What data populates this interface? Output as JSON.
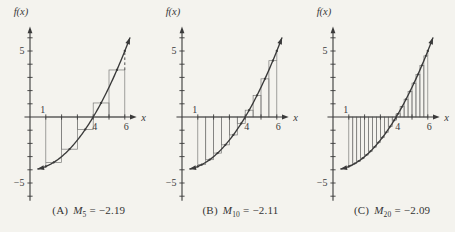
{
  "figure": {
    "background": "#f4f3ee",
    "ink": "#3a3a3a",
    "rect_line": "#7a7a78"
  },
  "chart_data": [
    {
      "type": "line",
      "xlabel": "x",
      "ylabel": "f(x)",
      "xlim": [
        -0.35,
        6.9
      ],
      "ylim": [
        -6.4,
        6.9
      ],
      "x_ticks": [
        1,
        2,
        3,
        4,
        5,
        6
      ],
      "y_ticks": [
        -6,
        -5,
        -4,
        -3,
        -2,
        -1,
        1,
        2,
        3,
        4,
        5,
        6
      ],
      "x_tick_labels": [
        {
          "v": 1,
          "t": "1",
          "side": "above"
        },
        {
          "v": 4,
          "t": "4",
          "side": "below"
        },
        {
          "v": 6,
          "t": "6",
          "side": "below"
        }
      ],
      "y_tick_labels": [
        {
          "v": 5,
          "t": "5"
        },
        {
          "v": -5,
          "t": "−5"
        }
      ],
      "curve": {
        "a": 0.25,
        "c": -4,
        "x_start": 0.5,
        "x_end": 6.32
      },
      "riemann": {
        "method": "midpoint",
        "n": 5,
        "a": 1,
        "b": 6,
        "midpoints": [
          1.5,
          2.5,
          3.5,
          4.5,
          5.5
        ],
        "heights": [
          -3.4375,
          -2.4375,
          -0.9375,
          1.0625,
          3.5625
        ]
      },
      "edges": {
        "left": {
          "x": 1,
          "y": -3.75
        },
        "right": {
          "x": 6,
          "y": 5,
          "dashed": true
        }
      },
      "caption": {
        "prefix": "(A)",
        "var": "M",
        "sub": "5",
        "value": "= −2.19"
      }
    },
    {
      "type": "line",
      "xlabel": "x",
      "ylabel": "f(x)",
      "xlim": [
        -0.35,
        6.9
      ],
      "ylim": [
        -6.4,
        6.9
      ],
      "x_ticks": [
        1,
        2,
        3,
        4,
        5,
        6
      ],
      "y_ticks": [
        -6,
        -5,
        -4,
        -3,
        -2,
        -1,
        1,
        2,
        3,
        4,
        5,
        6
      ],
      "x_tick_labels": [
        {
          "v": 1,
          "t": "1",
          "side": "above"
        },
        {
          "v": 4,
          "t": "4",
          "side": "below"
        },
        {
          "v": 6,
          "t": "6",
          "side": "below"
        }
      ],
      "y_tick_labels": [
        {
          "v": 5,
          "t": "5"
        },
        {
          "v": -5,
          "t": "−5"
        }
      ],
      "curve": {
        "a": 0.25,
        "c": -4,
        "x_start": 0.5,
        "x_end": 6.32
      },
      "riemann": {
        "method": "midpoint",
        "n": 10,
        "a": 1,
        "b": 6,
        "midpoints": [
          1.25,
          1.75,
          2.25,
          2.75,
          3.25,
          3.75,
          4.25,
          4.75,
          5.25,
          5.75
        ],
        "heights": [
          -3.6094,
          -3.2344,
          -2.7344,
          -2.1094,
          -1.3594,
          -0.4844,
          0.5156,
          1.6406,
          2.8906,
          4.2656
        ]
      },
      "edges": {
        "left": {
          "x": 1,
          "y": -3.75
        },
        "right": {
          "x": 6,
          "y": 5,
          "dashed": false
        }
      },
      "caption": {
        "prefix": "(B)",
        "var": "M",
        "sub": "10",
        "value": "= −2.11"
      }
    },
    {
      "type": "line",
      "xlabel": "x",
      "ylabel": "f(x)",
      "xlim": [
        -0.35,
        6.9
      ],
      "ylim": [
        -6.4,
        6.9
      ],
      "x_ticks": [
        1,
        2,
        3,
        4,
        5,
        6
      ],
      "y_ticks": [
        -6,
        -5,
        -4,
        -3,
        -2,
        -1,
        1,
        2,
        3,
        4,
        5,
        6
      ],
      "x_tick_labels": [
        {
          "v": 1,
          "t": "1",
          "side": "above"
        },
        {
          "v": 4,
          "t": "4",
          "side": "below"
        },
        {
          "v": 6,
          "t": "6",
          "side": "below"
        }
      ],
      "y_tick_labels": [
        {
          "v": 5,
          "t": "5"
        },
        {
          "v": -5,
          "t": "−5"
        }
      ],
      "curve": {
        "a": 0.25,
        "c": -4,
        "x_start": 0.5,
        "x_end": 6.32
      },
      "riemann": {
        "method": "midpoint",
        "n": 20,
        "a": 1,
        "b": 6,
        "midpoints": [
          1.125,
          1.375,
          1.625,
          1.875,
          2.125,
          2.375,
          2.625,
          2.875,
          3.125,
          3.375,
          3.625,
          3.875,
          4.125,
          4.375,
          4.625,
          4.875,
          5.125,
          5.375,
          5.625,
          5.875
        ],
        "heights": [
          -3.6836,
          -3.5273,
          -3.3398,
          -3.1211,
          -2.8711,
          -2.5898,
          -2.2773,
          -1.9336,
          -1.5586,
          -1.1523,
          -0.7148,
          -0.2461,
          0.2539,
          0.7852,
          1.3477,
          1.9414,
          2.5664,
          3.2227,
          3.9102,
          4.6289
        ]
      },
      "edges": {
        "left": {
          "x": 1,
          "y": -3.75
        },
        "right": {
          "x": 6,
          "y": 5,
          "dashed": false
        }
      },
      "caption": {
        "prefix": "(C)",
        "var": "M",
        "sub": "20",
        "value": "= −2.09"
      }
    }
  ]
}
